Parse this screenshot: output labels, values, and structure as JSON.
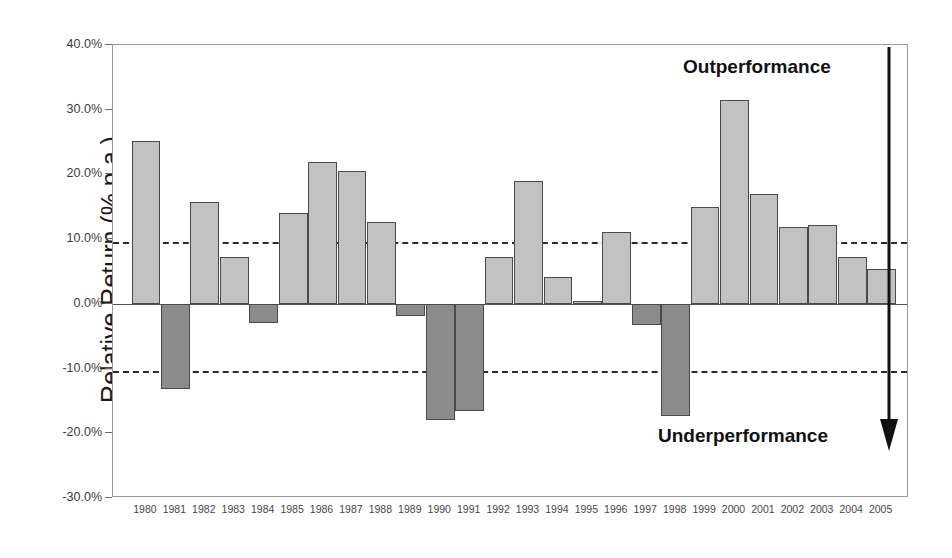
{
  "chart_data": {
    "type": "bar",
    "title": "",
    "xlabel": "",
    "ylabel": "Relative Return (% p.a.)",
    "ylim": [
      -30.0,
      40.0
    ],
    "grid": false,
    "legend": "none",
    "y_tick_labels": [
      "40.0%",
      "30.0%",
      "20.0%",
      "10.0%",
      "0.0%",
      "-10.0%",
      "-20.0%",
      "-30.0%"
    ],
    "y_tick_values": [
      40.0,
      30.0,
      20.0,
      10.0,
      0.0,
      -10.0,
      -20.0,
      -30.0
    ],
    "reference_lines": [
      9.6,
      -10.3
    ],
    "categories": [
      "1980",
      "1981",
      "1982",
      "1983",
      "1984",
      "1985",
      "1986",
      "1987",
      "1988",
      "1989",
      "1990",
      "1991",
      "1992",
      "1993",
      "1994",
      "1995",
      "1996",
      "1997",
      "1998",
      "1999",
      "2000",
      "2001",
      "2002",
      "2003",
      "2004",
      "2005"
    ],
    "values": [
      25.1,
      -13.2,
      15.7,
      7.2,
      -2.9,
      14.1,
      21.9,
      20.5,
      12.7,
      -1.9,
      -18.0,
      -16.6,
      7.2,
      19.0,
      4.2,
      0.5,
      11.1,
      -3.2,
      -17.3,
      15.0,
      31.5,
      16.9,
      11.9,
      12.2,
      7.2,
      5.4
    ],
    "colors": {
      "positive_bar": "#c2c2c2",
      "negative_bar": "#8b8b8b",
      "bar_outline": "#4a4a4a",
      "reference_line": "#2b2b2b",
      "axis": "#6b6b6b"
    }
  },
  "annotations": {
    "outperformance": "Outperformance",
    "underperformance": "Underperformance",
    "arrow_direction": "down"
  }
}
